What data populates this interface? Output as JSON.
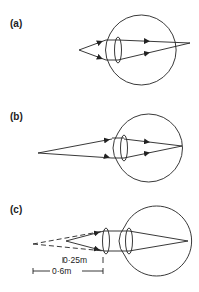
{
  "figure": {
    "panels": [
      {
        "id": "a",
        "label": "(a)"
      },
      {
        "id": "b",
        "label": "(b)"
      },
      {
        "id": "c",
        "label": "(c)"
      }
    ],
    "dimensions": {
      "near_point": "0·25m",
      "far_distance": "0·6m"
    },
    "colors": {
      "line": "#222222",
      "background": "#ffffff"
    }
  }
}
